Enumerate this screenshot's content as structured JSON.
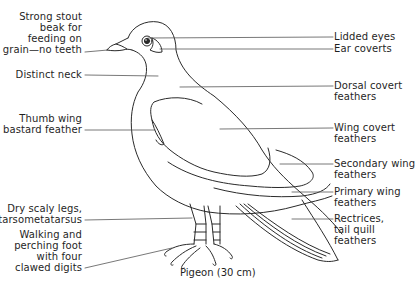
{
  "diagram": {
    "subject": "Pigeon",
    "caption": "Pigeon (30 cm)",
    "colors": {
      "line": "#2a2a2a",
      "text": "#1f1f1f",
      "background": "#ffffff"
    },
    "left_labels": [
      {
        "id": "beak",
        "lines": [
          "Strong stout",
          "beak for",
          "feeding on",
          "grain—no teeth"
        ]
      },
      {
        "id": "neck",
        "lines": [
          "Distinct neck"
        ]
      },
      {
        "id": "thumb-wing",
        "lines": [
          "Thumb wing",
          "bastard feather"
        ]
      },
      {
        "id": "legs",
        "lines": [
          "Dry scaly legs,",
          "tarsometatarsus"
        ]
      },
      {
        "id": "foot",
        "lines": [
          "Walking and",
          "perching foot",
          "with four",
          "clawed digits"
        ]
      }
    ],
    "right_labels": [
      {
        "id": "eyes",
        "lines": [
          "Lidded eyes"
        ]
      },
      {
        "id": "ear-coverts",
        "lines": [
          "Ear coverts"
        ]
      },
      {
        "id": "dorsal-covert",
        "lines": [
          "Dorsal covert",
          "feathers"
        ]
      },
      {
        "id": "wing-covert",
        "lines": [
          "Wing covert",
          "feathers"
        ]
      },
      {
        "id": "secondary-wing",
        "lines": [
          "Secondary wing",
          "feathers"
        ]
      },
      {
        "id": "primary-wing",
        "lines": [
          "Primary wing",
          "feathers"
        ]
      },
      {
        "id": "rectrices",
        "lines": [
          "Rectrices,",
          "tail quill",
          "feathers"
        ]
      }
    ]
  }
}
